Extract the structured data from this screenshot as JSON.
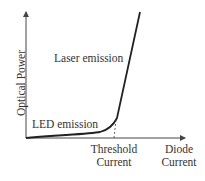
{
  "diagram": {
    "title": "",
    "y_axis_label": "Optical Power",
    "x_axis_labels": {
      "threshold": [
        "Threshold",
        "Current"
      ],
      "end": [
        "Diode",
        "Current"
      ]
    },
    "annotations": {
      "laser": "Laser emission",
      "led": "LED emission"
    },
    "colors": {
      "line": "#222222",
      "axis": "#444444",
      "text": "#333333"
    }
  }
}
